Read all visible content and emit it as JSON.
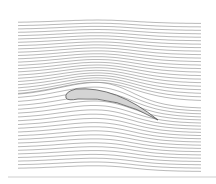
{
  "figure": {
    "type": "streamlines-around-airfoil",
    "line_color": "#8a8a8a",
    "airfoil_fill": "#d4d4d4",
    "airfoil_stroke": "#555555",
    "bottom_bar_color": "#e6e6e6"
  },
  "layout": {
    "x_left": 18,
    "x_right": 202,
    "y_top": 23,
    "y_bottom": 170,
    "num_lines": 44
  },
  "airfoil": {
    "leading_edge": [
      66,
      98
    ],
    "trailing_edge": [
      158,
      120
    ],
    "max_thickness": 6,
    "camber_peak": [
      96,
      90
    ]
  }
}
